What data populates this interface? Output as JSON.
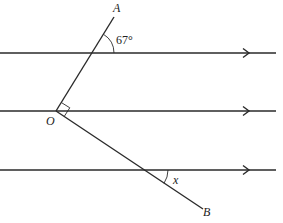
{
  "diagram": {
    "type": "geometry-parallel-lines",
    "parallel_lines": [
      {
        "id": "top",
        "y": 53,
        "arrow": true
      },
      {
        "id": "middle",
        "y": 111,
        "arrow": true
      },
      {
        "id": "bottom",
        "y": 170,
        "arrow": true
      }
    ],
    "points": {
      "O": {
        "label": "O",
        "note": "vertex on middle line"
      },
      "A": {
        "label": "A",
        "note": "end of ray OA, above top line"
      },
      "B": {
        "label": "B",
        "note": "end of ray OB, below bottom line"
      }
    },
    "angles": {
      "top_angle": {
        "label": "67°",
        "note": "angle between OA and top parallel line"
      },
      "right_angle_at_O": {
        "label": "",
        "note": "angle AOB marked as right angle"
      },
      "x_angle": {
        "label": "x",
        "note": "angle between OB and bottom parallel line"
      }
    }
  },
  "labels": {
    "A": "A",
    "B": "B",
    "O": "O",
    "angle_67": "67°",
    "angle_x": "x"
  }
}
